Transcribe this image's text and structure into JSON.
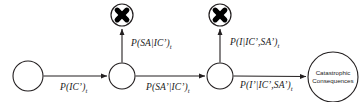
{
  "diagram": {
    "background_color": "#ffffff",
    "stroke_color": "#231f20",
    "canvas": {
      "width": 364,
      "height": 102
    }
  },
  "nodes": {
    "start": {
      "name": "start-node",
      "label": "",
      "cx": 28,
      "cy": 76,
      "r": 15
    },
    "state_ic": {
      "name": "state-node-ic",
      "label": "",
      "cx": 122,
      "cy": 76,
      "r": 13
    },
    "state_sa": {
      "name": "state-node-sa",
      "label": "",
      "cx": 220,
      "cy": 76,
      "r": 13
    },
    "terminal": {
      "name": "terminal-node",
      "line1": "Catastrophic",
      "line2": "Consequences",
      "cx": 333,
      "cy": 77,
      "r": 25
    },
    "cross_left": {
      "name": "cross-node-sa",
      "glyph": "cross-icon",
      "cx": 122,
      "cy": 15,
      "r": 11
    },
    "cross_right": {
      "name": "cross-node-i",
      "glyph": "cross-icon",
      "cx": 220,
      "cy": 15,
      "r": 11
    }
  },
  "edges": {
    "start_to_ic": {
      "name": "edge-start-to-ic",
      "label_html": "P(IC’)",
      "label_sub": "t",
      "x": 60,
      "y": 82
    },
    "ic_to_sa": {
      "name": "edge-ic-to-sa",
      "label_html": "P(SA’|IC’)",
      "label_sub": "t",
      "x": 146,
      "y": 82
    },
    "sa_to_terminal": {
      "name": "edge-sa-to-terminal",
      "label_html": "P(I’|IC’,SA’)",
      "label_sub": "t",
      "x": 240,
      "y": 80
    },
    "ic_to_cross": {
      "name": "edge-ic-to-cross",
      "label_html": "P(SA|IC’)",
      "label_sub": "t",
      "x": 131,
      "y": 38
    },
    "sa_to_cross": {
      "name": "edge-sa-to-cross",
      "label_html": "P(I|IC’,SA’)",
      "label_sub": "t",
      "x": 230,
      "y": 37
    }
  }
}
